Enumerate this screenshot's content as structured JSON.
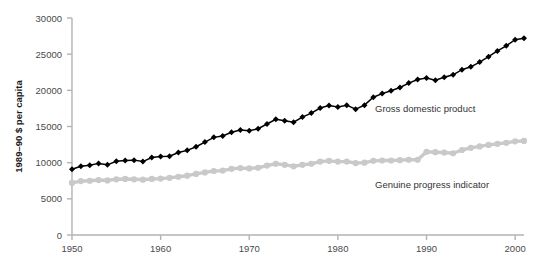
{
  "chart_data": {
    "type": "line",
    "title": "",
    "xlabel": "",
    "ylabel": "1989–90 $ per capita",
    "xlim": [
      1950,
      2001
    ],
    "ylim": [
      0,
      30000
    ],
    "grid": false,
    "legend_position": "inline-annotation",
    "x_ticks": [
      "1950",
      "1960",
      "1970",
      "1980",
      "1990",
      "2000"
    ],
    "x_tick_values": [
      1950,
      1960,
      1970,
      1980,
      1990,
      2000
    ],
    "y_ticks": [
      "0",
      "5000",
      "10000",
      "15000",
      "20000",
      "25000",
      "30000"
    ],
    "y_tick_values": [
      0,
      5000,
      10000,
      15000,
      20000,
      25000,
      30000
    ],
    "x": [
      1950,
      1951,
      1952,
      1953,
      1954,
      1955,
      1956,
      1957,
      1958,
      1959,
      1960,
      1961,
      1962,
      1963,
      1964,
      1965,
      1966,
      1967,
      1968,
      1969,
      1970,
      1971,
      1972,
      1973,
      1974,
      1975,
      1976,
      1977,
      1978,
      1979,
      1980,
      1981,
      1982,
      1983,
      1984,
      1985,
      1986,
      1987,
      1988,
      1989,
      1990,
      1991,
      1992,
      1993,
      1994,
      1995,
      1996,
      1997,
      1998,
      1999,
      2000,
      2001
    ],
    "series": [
      {
        "name": "Gross domestic product",
        "marker": "diamond",
        "color": "#000000",
        "values": [
          9100,
          9500,
          9650,
          9900,
          9700,
          10200,
          10300,
          10350,
          10150,
          10700,
          10850,
          10900,
          11400,
          11700,
          12200,
          12850,
          13500,
          13700,
          14200,
          14500,
          14400,
          14700,
          15350,
          16000,
          15800,
          15600,
          16300,
          16850,
          17550,
          17900,
          17700,
          17950,
          17400,
          17950,
          19050,
          19550,
          19950,
          20400,
          21000,
          21500,
          21700,
          21400,
          21800,
          22150,
          22850,
          23250,
          23900,
          24650,
          25450,
          26150,
          27000,
          27200
        ]
      },
      {
        "name": "Genuine progress indicator",
        "marker": "circle",
        "color": "#c9c9c9",
        "values": [
          7200,
          7450,
          7500,
          7600,
          7550,
          7700,
          7750,
          7700,
          7650,
          7750,
          7800,
          7900,
          8050,
          8200,
          8450,
          8650,
          8850,
          8900,
          9150,
          9250,
          9200,
          9300,
          9600,
          9850,
          9700,
          9500,
          9700,
          9850,
          10150,
          10250,
          10150,
          10150,
          9950,
          10000,
          10250,
          10300,
          10300,
          10350,
          10400,
          10400,
          11500,
          11450,
          11400,
          11300,
          11750,
          12050,
          12250,
          12450,
          12600,
          12750,
          12950,
          13000
        ]
      }
    ],
    "annotations": [
      {
        "text": "Gross domestic product",
        "x_px": 375,
        "y_px": 112,
        "series": "Gross domestic product"
      },
      {
        "text": "Genuine progress indicator",
        "x_px": 375,
        "y_px": 188,
        "series": "Genuine progress indicator"
      }
    ]
  }
}
